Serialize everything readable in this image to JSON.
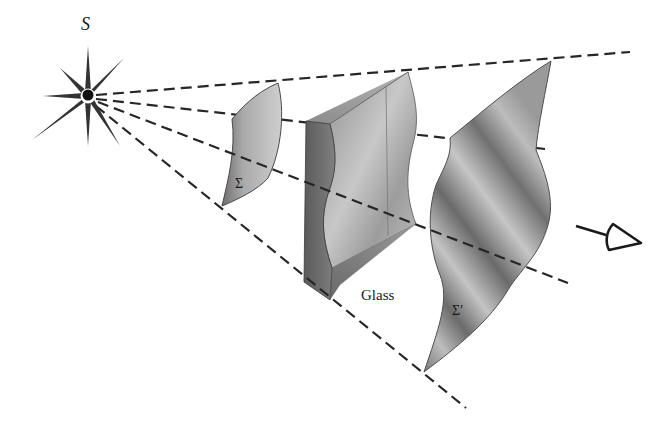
{
  "diagram": {
    "type": "optics-wavefront-illustration",
    "labels": {
      "source": "S",
      "incident_wavefront": "Σ",
      "glass": "Glass",
      "emerging_wavefront": "Σ′"
    },
    "elements": [
      {
        "id": "source",
        "kind": "point-light-star",
        "label": "S",
        "center": [
          88,
          96
        ]
      },
      {
        "id": "wavefront-sigma",
        "kind": "curved-wavefront-surface",
        "label": "Σ"
      },
      {
        "id": "glass-slab",
        "kind": "irregular-glass-block",
        "label": "Glass"
      },
      {
        "id": "wavefront-sigma-prime",
        "kind": "distorted-wavefront-surface",
        "label": "Σ′"
      },
      {
        "id": "eye",
        "kind": "observer-eye-symbol"
      }
    ],
    "rays": [
      {
        "from": [
          88,
          96
        ],
        "to": [
          630,
          52
        ]
      },
      {
        "from": [
          88,
          96
        ],
        "to": [
          545,
          149
        ]
      },
      {
        "from": [
          88,
          96
        ],
        "to": [
          568,
          283
        ]
      },
      {
        "from": [
          88,
          96
        ],
        "to": [
          466,
          408
        ]
      }
    ],
    "colors": {
      "ink": "#262626",
      "surface_light": "#c9c9c9",
      "surface_mid": "#9a9a9a",
      "surface_dark": "#5e5e5e",
      "background": "#ffffff"
    }
  }
}
